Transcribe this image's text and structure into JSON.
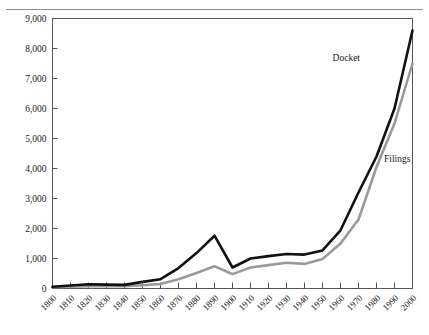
{
  "figure": {
    "top_cut_text": "",
    "background": "#ffffff"
  },
  "axes": {
    "y_tick_labels": [
      "9,000",
      "8,000",
      "7,000",
      "6,000",
      "5,000",
      "4,000",
      "3,000",
      "2,000",
      "1,000",
      "0"
    ],
    "x_tick_labels": [
      "1800",
      "1810",
      "1820",
      "1830",
      "1840",
      "1850",
      "1860",
      "1870",
      "1880",
      "1890",
      "1900",
      "1910",
      "1920",
      "1930",
      "1940",
      "1950",
      "1960",
      "1970",
      "1980",
      "1990",
      "2000"
    ],
    "border_color": "#555555",
    "tick_color": "#555555"
  },
  "series_labels": {
    "docket": "Docket",
    "filings": "Filings"
  },
  "chart_data": {
    "type": "line",
    "title": "",
    "subtitle": "",
    "xlabel": "",
    "ylabel": "",
    "xlim": [
      1800,
      2000
    ],
    "ylim": [
      0,
      9000
    ],
    "ytick_step": 1000,
    "grid": false,
    "legend_position": "inline-annotation",
    "x": [
      1800,
      1810,
      1820,
      1830,
      1840,
      1850,
      1860,
      1870,
      1880,
      1890,
      1900,
      1910,
      1920,
      1930,
      1940,
      1950,
      1960,
      1970,
      1980,
      1990,
      2000
    ],
    "series": [
      {
        "name": "Docket",
        "color": "#111111",
        "width": 2.6,
        "values": [
          60,
          100,
          140,
          130,
          120,
          220,
          310,
          680,
          1180,
          1760,
          700,
          1000,
          1080,
          1150,
          1130,
          1270,
          1940,
          3200,
          4400,
          6000,
          8600
        ]
      },
      {
        "name": "Filings",
        "color": "#9a9a9a",
        "width": 2.6,
        "values": [
          40,
          60,
          80,
          80,
          80,
          110,
          150,
          310,
          520,
          740,
          480,
          700,
          780,
          860,
          820,
          980,
          1500,
          2300,
          4050,
          5500,
          7500
        ]
      }
    ]
  }
}
